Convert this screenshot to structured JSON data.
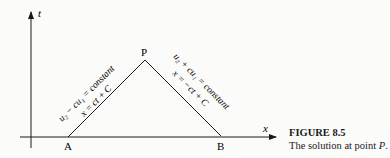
{
  "figure": {
    "number": "FIGURE 8.5",
    "caption_prefix": "The solution at point ",
    "caption_point": "P",
    "caption_suffix": "."
  },
  "diagram": {
    "axes": {
      "vertical": "t",
      "horizontal": "x"
    },
    "points": {
      "A": "A",
      "B": "B",
      "P": "P"
    },
    "left_line": {
      "eq1": "u₂ − cu₁ = constant",
      "eq2": "x = ct + C"
    },
    "right_line": {
      "eq1": "u₂ + cu₁ = constant",
      "eq2": "x = −ct + C"
    }
  }
}
